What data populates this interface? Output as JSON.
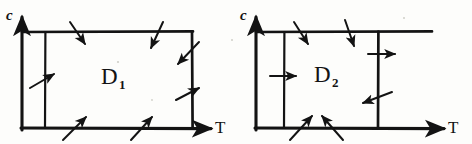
{
  "figure": {
    "background_color": "#fdfdfb",
    "ink_color": "#131313",
    "panels": [
      {
        "id": "panel-d1",
        "region_label": "D",
        "region_subscript": "1",
        "axes": {
          "vertical_label": "c",
          "horizontal_label": "T"
        },
        "box": {
          "left": 22,
          "right": 192,
          "top": 32,
          "bottom": 128
        },
        "inner_vertical_x": 45,
        "arrows": [
          {
            "name": "arrow-top-left-inward",
            "edge": "top",
            "direction": "down-right",
            "x1": 70,
            "y1": 22,
            "x2": 85,
            "y2": 44
          },
          {
            "name": "arrow-top-right-inward",
            "edge": "top",
            "direction": "down-left",
            "x1": 163,
            "y1": 22,
            "x2": 151,
            "y2": 48
          },
          {
            "name": "arrow-left-inner-inward",
            "edge": "left",
            "direction": "up-right",
            "x1": 30,
            "y1": 88,
            "x2": 54,
            "y2": 74
          },
          {
            "name": "arrow-right-upper-inward",
            "edge": "right",
            "direction": "down-left",
            "x1": 199,
            "y1": 42,
            "x2": 178,
            "y2": 64
          },
          {
            "name": "arrow-right-lower-inward",
            "edge": "right",
            "direction": "up-right",
            "x1": 176,
            "y1": 100,
            "x2": 199,
            "y2": 88
          },
          {
            "name": "arrow-bottom-left-inward",
            "edge": "bottom",
            "direction": "up-right",
            "x1": 63,
            "y1": 140,
            "x2": 86,
            "y2": 117
          },
          {
            "name": "arrow-bottom-right-inward",
            "edge": "bottom",
            "direction": "up-right",
            "x1": 131,
            "y1": 140,
            "x2": 152,
            "y2": 117
          }
        ]
      },
      {
        "id": "panel-d2",
        "region_label": "D",
        "region_subscript": "2",
        "axes": {
          "vertical_label": "c",
          "horizontal_label": "T"
        },
        "box": {
          "left": 256,
          "right": 432,
          "top": 32,
          "bottom": 128
        },
        "inner_vertical_left_x": 284,
        "inner_vertical_right_x": 378,
        "arrows": [
          {
            "name": "arrow-top-left-inward",
            "edge": "top",
            "direction": "down-right",
            "x1": 294,
            "y1": 22,
            "x2": 308,
            "y2": 44
          },
          {
            "name": "arrow-top-mid-inward",
            "edge": "top",
            "direction": "down-right",
            "x1": 345,
            "y1": 20,
            "x2": 354,
            "y2": 46
          },
          {
            "name": "arrow-left-inner-rightward",
            "edge": "left",
            "direction": "right",
            "x1": 270,
            "y1": 76,
            "x2": 296,
            "y2": 76
          },
          {
            "name": "arrow-right-upper-rightward",
            "edge": "right",
            "direction": "right",
            "x1": 368,
            "y1": 54,
            "x2": 395,
            "y2": 54
          },
          {
            "name": "arrow-right-lower-outward",
            "edge": "right",
            "direction": "down-left",
            "x1": 392,
            "y1": 92,
            "x2": 363,
            "y2": 103
          },
          {
            "name": "arrow-bottom-left-inward",
            "edge": "bottom",
            "direction": "up-right",
            "x1": 290,
            "y1": 140,
            "x2": 312,
            "y2": 116
          },
          {
            "name": "arrow-bottom-mid-inward",
            "edge": "bottom",
            "direction": "up-left",
            "x1": 343,
            "y1": 140,
            "x2": 322,
            "y2": 116
          }
        ]
      }
    ]
  }
}
